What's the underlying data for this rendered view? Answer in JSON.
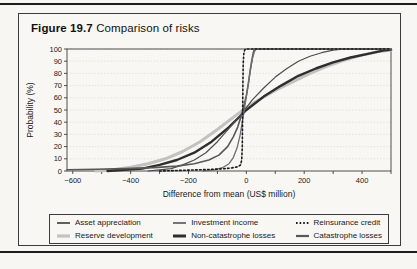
{
  "figure": {
    "label": "Figure 19.7",
    "title": "Comparison of risks"
  },
  "chart_data": {
    "type": "line",
    "title": "Figure 19.7 Comparison of risks",
    "xlabel": "Difference from mean (US$ million)",
    "ylabel": "Probability (%)",
    "xlim": [
      -620,
      500
    ],
    "ylim": [
      0,
      100
    ],
    "x_ticks": [
      -600,
      -400,
      -200,
      0,
      200,
      400
    ],
    "y_ticks": [
      0,
      10,
      20,
      30,
      40,
      50,
      60,
      70,
      80,
      90,
      100
    ],
    "grid": "horizontal-dotted",
    "grid_color": "#d9d8d4",
    "axis_color": "#3c3c3c",
    "legend_position": "bottom-boxed",
    "series": [
      {
        "name": "Reserve development",
        "color": "#c3c2be",
        "width": 3,
        "dash": "",
        "points": [
          [
            -520,
            0
          ],
          [
            -460,
            1
          ],
          [
            -400,
            3
          ],
          [
            -340,
            6
          ],
          [
            -280,
            10
          ],
          [
            -220,
            16
          ],
          [
            -160,
            24
          ],
          [
            -100,
            34
          ],
          [
            -40,
            45
          ],
          [
            0,
            52
          ],
          [
            40,
            58
          ],
          [
            100,
            66
          ],
          [
            160,
            73
          ],
          [
            220,
            80
          ],
          [
            280,
            86
          ],
          [
            340,
            91
          ],
          [
            400,
            95
          ],
          [
            460,
            98
          ],
          [
            500,
            99
          ]
        ]
      },
      {
        "name": "Non-catastrophe losses",
        "color": "#2e2e2e",
        "width": 2.4,
        "dash": "",
        "points": [
          [
            -480,
            0
          ],
          [
            -420,
            1
          ],
          [
            -360,
            2
          ],
          [
            -300,
            5
          ],
          [
            -240,
            9
          ],
          [
            -180,
            15
          ],
          [
            -120,
            24
          ],
          [
            -60,
            36
          ],
          [
            0,
            50
          ],
          [
            60,
            61
          ],
          [
            120,
            70
          ],
          [
            180,
            78
          ],
          [
            240,
            84
          ],
          [
            300,
            89
          ],
          [
            360,
            93
          ],
          [
            420,
            96
          ],
          [
            480,
            99
          ],
          [
            500,
            99.5
          ]
        ]
      },
      {
        "name": "Asset appreciation",
        "color": "#4d4d4d",
        "width": 1.2,
        "dash": "",
        "points": [
          [
            -340,
            0
          ],
          [
            -300,
            1
          ],
          [
            -260,
            2
          ],
          [
            -220,
            5
          ],
          [
            -180,
            9
          ],
          [
            -140,
            15
          ],
          [
            -100,
            24
          ],
          [
            -60,
            35
          ],
          [
            -20,
            46
          ],
          [
            0,
            52
          ],
          [
            20,
            58
          ],
          [
            60,
            68
          ],
          [
            100,
            77
          ],
          [
            140,
            84
          ],
          [
            180,
            90
          ],
          [
            220,
            94
          ],
          [
            260,
            97
          ],
          [
            300,
            99
          ],
          [
            340,
            100
          ],
          [
            500,
            100
          ]
        ]
      },
      {
        "name": "Catastrophe losses",
        "color": "#585858",
        "width": 1.6,
        "dash": "",
        "points": [
          [
            -620,
            1
          ],
          [
            -520,
            1.4
          ],
          [
            -420,
            2
          ],
          [
            -320,
            2.8
          ],
          [
            -240,
            4
          ],
          [
            -180,
            6
          ],
          [
            -130,
            9
          ],
          [
            -95,
            13
          ],
          [
            -65,
            20
          ],
          [
            -45,
            28
          ],
          [
            -30,
            36
          ],
          [
            -18,
            45
          ],
          [
            -8,
            54
          ],
          [
            0,
            62
          ],
          [
            7,
            72
          ],
          [
            13,
            82
          ],
          [
            19,
            91
          ],
          [
            24,
            97
          ],
          [
            28,
            100
          ],
          [
            500,
            100
          ]
        ]
      },
      {
        "name": "Investment income",
        "color": "#6e6e6e",
        "width": 1.3,
        "dash": "",
        "points": [
          [
            -150,
            0
          ],
          [
            -110,
            1
          ],
          [
            -80,
            3
          ],
          [
            -60,
            6
          ],
          [
            -45,
            11
          ],
          [
            -32,
            19
          ],
          [
            -22,
            29
          ],
          [
            -14,
            40
          ],
          [
            -6,
            52
          ],
          [
            2,
            64
          ],
          [
            9,
            75
          ],
          [
            16,
            86
          ],
          [
            22,
            93
          ],
          [
            28,
            98
          ],
          [
            34,
            100
          ],
          [
            500,
            100
          ]
        ]
      },
      {
        "name": "Reinsurance credit",
        "color": "#1a1a1a",
        "width": 1.6,
        "dash": "1.6,2.4",
        "points": [
          [
            -300,
            0
          ],
          [
            -200,
            0.7
          ],
          [
            -130,
            1.2
          ],
          [
            -80,
            1.8
          ],
          [
            -50,
            2.5
          ],
          [
            -30,
            3.5
          ],
          [
            -20,
            5
          ],
          [
            -16,
            9
          ],
          [
            -14,
            20
          ],
          [
            -13,
            45
          ],
          [
            -12,
            70
          ],
          [
            -11,
            88
          ],
          [
            -9,
            96
          ],
          [
            -6,
            99
          ],
          [
            -3,
            100
          ],
          [
            500,
            100
          ]
        ]
      }
    ],
    "legend_rows": [
      [
        2,
        4,
        5
      ],
      [
        0,
        1,
        3
      ]
    ]
  }
}
